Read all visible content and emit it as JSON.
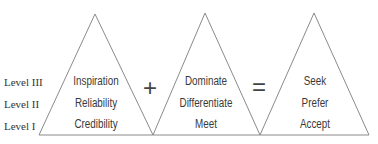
{
  "diagram": {
    "levels": [
      "Level III",
      "Level II",
      "Level I"
    ],
    "triangles": [
      {
        "rows": [
          "Inspiration",
          "Reliability",
          "Credibility"
        ]
      },
      {
        "rows": [
          "Dominate",
          "Differentiate",
          "Meet"
        ]
      },
      {
        "rows": [
          "Seek",
          "Prefer",
          "Accept"
        ]
      }
    ],
    "operators": {
      "plus": "+",
      "equals": "="
    },
    "colors": {
      "stroke": "#8a8a8a",
      "text": "#3a3a3a",
      "background": "#ffffff"
    }
  }
}
